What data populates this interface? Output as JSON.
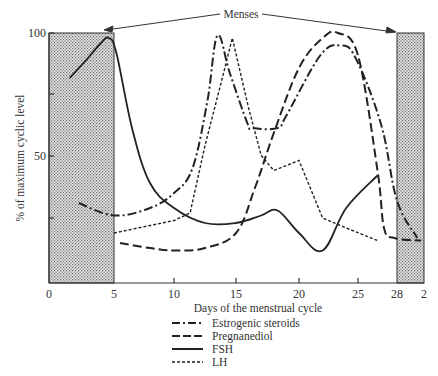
{
  "chart_data": {
    "type": "line",
    "title": "",
    "xlabel": "Days of the menstrual cycle",
    "ylabel": "% of maximum cyclic level",
    "x_ticks": [
      "0",
      "5",
      "10",
      "15",
      "20",
      "25",
      "28",
      "2"
    ],
    "y_ticks": [
      "100",
      "50"
    ],
    "y_minor_ticks": [
      25,
      75
    ],
    "xlim": [
      0,
      30
    ],
    "ylim": [
      0,
      100
    ],
    "grid": false,
    "legend_position": "bottom",
    "annotations": [
      {
        "text": "Menses",
        "type": "double-arrow",
        "targets": [
          "shaded day 0-5",
          "shaded day 28-2"
        ]
      }
    ],
    "shaded_regions": [
      {
        "label": "Menses",
        "x_start": 0,
        "x_end": 5
      },
      {
        "label": "Menses",
        "x_start": 28,
        "x_end": 30
      }
    ],
    "series": [
      {
        "name": "Estrogenic steroids",
        "style": "dash-dot",
        "x": [
          2.3,
          5,
          8,
          10,
          11.5,
          12.7,
          13.5,
          14.5,
          15.9,
          16.3,
          18.3,
          19,
          21.8,
          23.5,
          24.8,
          26.8,
          28,
          29.5
        ],
        "y": [
          32,
          27,
          30,
          36,
          46,
          73,
          99,
          84,
          64,
          62,
          62,
          67,
          91,
          95,
          90,
          63,
          33,
          18
        ]
      },
      {
        "name": "Pregnanediol",
        "style": "long-dash",
        "x": [
          5.5,
          8,
          10,
          12.5,
          15,
          16.5,
          18,
          20,
          22,
          23.3,
          25,
          26.5,
          27,
          27.8,
          29.8
        ],
        "y": [
          16,
          14,
          13,
          14,
          20,
          38,
          60,
          86,
          98,
          100,
          91,
          45,
          22,
          18,
          17
        ]
      },
      {
        "name": "FSH",
        "style": "solid",
        "x": [
          1.6,
          3,
          4,
          4.6,
          5.2,
          6.5,
          8,
          10,
          12.5,
          15,
          17,
          18.3,
          20,
          22,
          24,
          26.5
        ],
        "y": [
          82,
          90,
          96,
          98,
          92,
          62,
          40,
          30,
          24,
          24,
          27,
          29,
          20,
          13,
          30,
          43
        ]
      },
      {
        "name": "LH",
        "style": "short-dash",
        "x": [
          5,
          8,
          10,
          11.3,
          12.5,
          14,
          14.7,
          16,
          17,
          18,
          20,
          22,
          24,
          26.5
        ],
        "y": [
          20,
          23,
          25,
          28,
          55,
          84,
          98,
          70,
          51,
          45,
          49,
          26,
          22,
          17
        ]
      }
    ]
  },
  "legend": [
    {
      "label": "Estrogenic steroids",
      "style": "dash-dot"
    },
    {
      "label": "Pregnanediol",
      "style": "long-dash"
    },
    {
      "label": "FSH",
      "style": "solid"
    },
    {
      "label": "LH",
      "style": "short-dash"
    }
  ],
  "annotation": {
    "menses_label": "Menses"
  }
}
